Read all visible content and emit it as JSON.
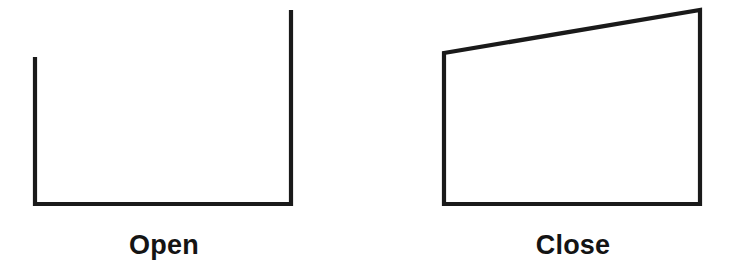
{
  "canvas": {
    "width": 736,
    "height": 272,
    "background_color": "#ffffff"
  },
  "style": {
    "stroke_color": "#1a1a1a",
    "stroke_width": 4,
    "text_color": "#141414",
    "caption_font_size": 27,
    "caption_font_weight": "bold"
  },
  "figures": [
    {
      "id": "open",
      "caption": "Open",
      "shape_type": "polyline",
      "closed": false,
      "description": "open-u-shape-polyline",
      "points": "35,57 35,204 291,204 291,10"
    },
    {
      "id": "close",
      "caption": "Close",
      "shape_type": "polygon",
      "closed": true,
      "description": "closed-quadrilateral",
      "points": "444,53 700,10 700,204 444,204"
    }
  ],
  "labels": {
    "open": "Open",
    "close": "Close"
  }
}
